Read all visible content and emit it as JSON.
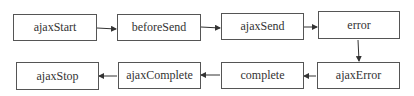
{
  "diagram": {
    "type": "flowchart",
    "nodes": [
      {
        "id": "ajaxStart",
        "label": "ajaxStart"
      },
      {
        "id": "beforeSend",
        "label": "beforeSend"
      },
      {
        "id": "ajaxSend",
        "label": "ajaxSend"
      },
      {
        "id": "error",
        "label": "error"
      },
      {
        "id": "ajaxError",
        "label": "ajaxError"
      },
      {
        "id": "complete",
        "label": "complete"
      },
      {
        "id": "ajaxComplete",
        "label": "ajaxComplete"
      },
      {
        "id": "ajaxStop",
        "label": "ajaxStop"
      }
    ],
    "edges": [
      [
        "ajaxStart",
        "beforeSend"
      ],
      [
        "beforeSend",
        "ajaxSend"
      ],
      [
        "ajaxSend",
        "error"
      ],
      [
        "error",
        "ajaxError"
      ],
      [
        "ajaxError",
        "complete"
      ],
      [
        "complete",
        "ajaxComplete"
      ],
      [
        "ajaxComplete",
        "ajaxStop"
      ]
    ]
  }
}
